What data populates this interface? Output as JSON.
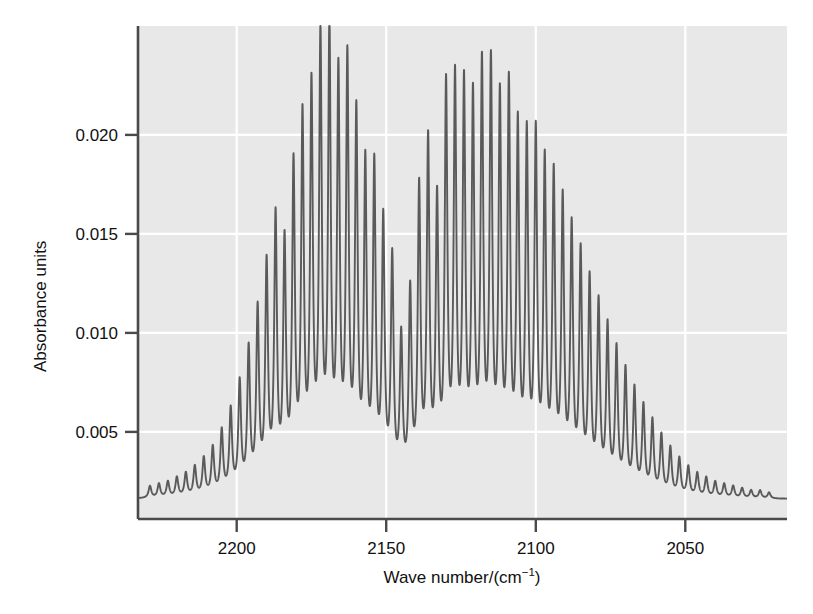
{
  "chart_data": {
    "type": "line",
    "title": "",
    "subtitle": "",
    "xlabel_parts": {
      "main": "Wave number/(cm",
      "superscript": "−1",
      "tail": ")"
    },
    "xlabel": "Wave number/(cm−1)",
    "ylabel": "Absorbance units",
    "x_ticks": [
      2200,
      2150,
      2100,
      2050
    ],
    "x_tick_labels": [
      "2200",
      "2150",
      "2100",
      "2050"
    ],
    "y_ticks": [
      0.005,
      0.01,
      0.015,
      0.02
    ],
    "y_tick_labels": [
      "0.005",
      "0.010",
      "0.015",
      "0.020"
    ],
    "xlim": [
      2233,
      2016
    ],
    "ylim": [
      0.0006,
      0.0255
    ],
    "x_axis_direction": "descending",
    "grid": true,
    "grid_color": "#ffffff",
    "plot_background": "#e8e8e8",
    "line_color": "#5a5a5a",
    "axis_color": "#4a4a4a",
    "legend": "none",
    "legend_position": "none",
    "baseline": 0.0016,
    "bands": [
      {
        "name": "band-1",
        "center": 2172.0,
        "peak_absorbance": 0.024,
        "line_spacing_cm1": 3.1,
        "envelope_width": 28.0,
        "range": [
          2232,
          2146
        ]
      },
      {
        "name": "band-2",
        "center": 2117.0,
        "peak_absorbance": 0.0223,
        "line_spacing_cm1": 3.1,
        "envelope_width": 30.0,
        "range": [
          2143,
          2018
        ]
      }
    ],
    "series": [
      {
        "name": "absorbance",
        "comment": "Peak maxima read off the plot: each entry is [wavenumber_cm-1, absorbance_units]",
        "peaks": [
          [
            2229.0,
            0.0022
          ],
          [
            2226.0,
            0.0023
          ],
          [
            2223.0,
            0.0024
          ],
          [
            2220.0,
            0.0026
          ],
          [
            2217.0,
            0.0028
          ],
          [
            2214.0,
            0.0031
          ],
          [
            2211.0,
            0.0035
          ],
          [
            2208.0,
            0.004
          ],
          [
            2205.0,
            0.0048
          ],
          [
            2202.0,
            0.0058
          ],
          [
            2199.0,
            0.0071
          ],
          [
            2196.0,
            0.0087
          ],
          [
            2193.0,
            0.0106
          ],
          [
            2190.0,
            0.0128
          ],
          [
            2187.0,
            0.0151
          ],
          [
            2184.0,
            0.0137
          ],
          [
            2181.0,
            0.0175
          ],
          [
            2178.0,
            0.0198
          ],
          [
            2175.0,
            0.0212
          ],
          [
            2172.0,
            0.0236
          ],
          [
            2169.0,
            0.024
          ],
          [
            2166.0,
            0.0218
          ],
          [
            2163.0,
            0.0226
          ],
          [
            2160.0,
            0.0199
          ],
          [
            2157.0,
            0.0175
          ],
          [
            2154.0,
            0.0175
          ],
          [
            2151.0,
            0.0148
          ],
          [
            2148.0,
            0.013
          ],
          [
            2145.0,
            0.009
          ],
          [
            2142.0,
            0.0113
          ],
          [
            2139.0,
            0.0164
          ],
          [
            2136.0,
            0.0187
          ],
          [
            2133.0,
            0.0156
          ],
          [
            2130.0,
            0.0213
          ],
          [
            2127.0,
            0.0216
          ],
          [
            2124.0,
            0.0213
          ],
          [
            2121.0,
            0.0206
          ],
          [
            2118.0,
            0.0222
          ],
          [
            2115.0,
            0.0223
          ],
          [
            2112.0,
            0.0206
          ],
          [
            2109.0,
            0.0213
          ],
          [
            2106.0,
            0.0193
          ],
          [
            2103.0,
            0.0189
          ],
          [
            2100.0,
            0.019
          ],
          [
            2097.0,
            0.0176
          ],
          [
            2094.0,
            0.017
          ],
          [
            2091.0,
            0.0158
          ],
          [
            2088.0,
            0.0145
          ],
          [
            2085.0,
            0.0133
          ],
          [
            2082.0,
            0.012
          ],
          [
            2079.0,
            0.0109
          ],
          [
            2076.0,
            0.0098
          ],
          [
            2073.0,
            0.0087
          ],
          [
            2070.0,
            0.0077
          ],
          [
            2067.0,
            0.0068
          ],
          [
            2064.0,
            0.006
          ],
          [
            2061.0,
            0.0053
          ],
          [
            2058.0,
            0.0046
          ],
          [
            2055.0,
            0.004
          ],
          [
            2052.0,
            0.0035
          ],
          [
            2049.0,
            0.0031
          ],
          [
            2046.0,
            0.0028
          ],
          [
            2043.0,
            0.0026
          ],
          [
            2040.0,
            0.0024
          ],
          [
            2037.0,
            0.0023
          ],
          [
            2034.0,
            0.0022
          ],
          [
            2031.0,
            0.0021
          ],
          [
            2028.0,
            0.002
          ],
          [
            2025.0,
            0.002
          ],
          [
            2022.0,
            0.0019
          ]
        ]
      }
    ]
  }
}
